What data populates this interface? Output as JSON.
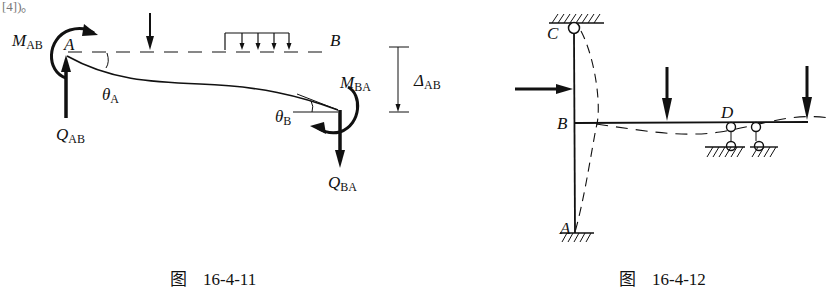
{
  "header_fragment": "[4])。",
  "figures": [
    {
      "id": "fig-16-4-11",
      "caption_prefix": "图",
      "caption_number": "16-4-11",
      "labels": {
        "node_a": "A",
        "node_b": "B",
        "moment_ab": "M",
        "moment_ab_sub": "AB",
        "moment_ba": "M",
        "moment_ba_sub": "BA",
        "shear_ab": "Q",
        "shear_ab_sub": "AB",
        "shear_ba": "Q",
        "shear_ba_sub": "BA",
        "theta_a": "θ",
        "theta_a_sub": "A",
        "theta_b": "θ",
        "theta_b_sub": "B",
        "delta": "Δ",
        "delta_sub": "AB"
      }
    },
    {
      "id": "fig-16-4-12",
      "caption_prefix": "图",
      "caption_number": "16-4-12",
      "labels": {
        "node_a": "A",
        "node_b": "B",
        "node_c": "C",
        "node_d": "D"
      }
    }
  ]
}
